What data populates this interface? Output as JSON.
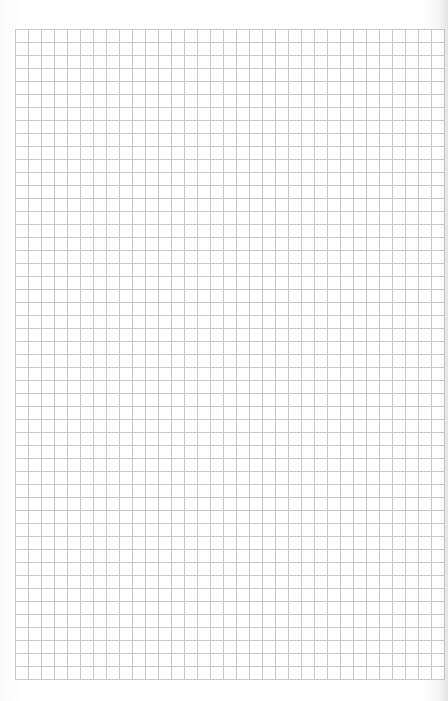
{
  "sheet": {
    "type": "graph-paper",
    "background_color": "#ffffff",
    "grid_line_color": "#c9c9c9",
    "grid": {
      "left": 15,
      "top": 29,
      "cell_size": 13,
      "columns": 33,
      "rows": 50
    }
  }
}
